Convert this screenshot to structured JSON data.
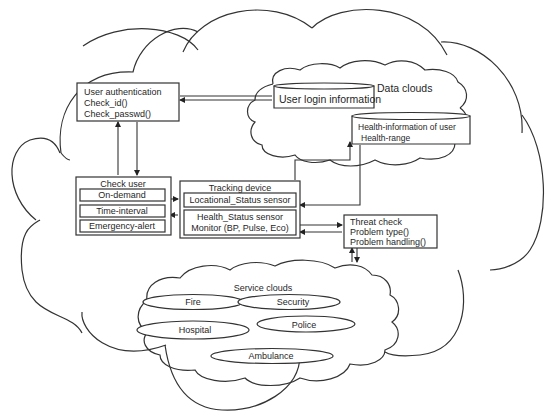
{
  "diagram": {
    "data_clouds": {
      "label": "Data clouds",
      "user_login_db": "User login information",
      "health_db": {
        "line1": "Health-information of user",
        "line2": "Health-range"
      }
    },
    "user_authentication": {
      "title": "User authentication",
      "methods": [
        "Check_id()",
        "Check_passwd()"
      ]
    },
    "check_user": {
      "title": "Check user",
      "items": [
        "On-demand",
        "Time-interval",
        "Emergency-alert"
      ]
    },
    "tracking_device": {
      "title": "Tracking device",
      "sensors": [
        {
          "line1": "Locational_Status sensor"
        },
        {
          "line1": "Health_Status sensor",
          "line2": "Monitor (BP, Pulse, Eco)"
        }
      ]
    },
    "threat_check": {
      "title": "Threat check",
      "methods": [
        "Problem type()",
        "Problem handling()"
      ]
    },
    "service_clouds": {
      "label": "Service clouds",
      "services": [
        "Fire",
        "Security",
        "Hospital",
        "Police",
        "Ambulance"
      ]
    }
  }
}
